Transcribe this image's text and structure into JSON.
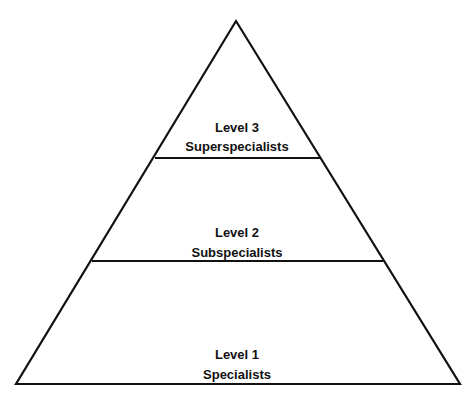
{
  "diagram": {
    "type": "pyramid",
    "colors": {
      "stroke": "#111111",
      "fill": "#ffffff"
    },
    "levels": [
      {
        "level": "Level 3",
        "name": "Superspecialists",
        "position": "top"
      },
      {
        "level": "Level 2",
        "name": "Subspecialists",
        "position": "middle"
      },
      {
        "level": "Level 1",
        "name": "Specialists",
        "position": "bottom"
      }
    ]
  }
}
